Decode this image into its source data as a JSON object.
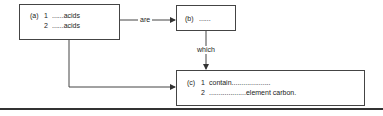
{
  "diagram": {
    "box_a": {
      "tag": "(a)",
      "lines": [
        {
          "num": "1",
          "text": "......acids"
        },
        {
          "num": "2",
          "text": "......acids"
        }
      ]
    },
    "box_b": {
      "tag": "(b)",
      "text": "......"
    },
    "box_c": {
      "tag": "(c)",
      "lines": [
        {
          "num": "1",
          "text": "contain...................."
        },
        {
          "num": "2",
          "text": "...................element carbon."
        }
      ]
    },
    "connectors": {
      "a_to_b": "are",
      "b_to_c": "which",
      "a_to_c": ""
    },
    "colors": {
      "line": "#444444",
      "text": "#222222",
      "background": "#ffffff"
    }
  }
}
